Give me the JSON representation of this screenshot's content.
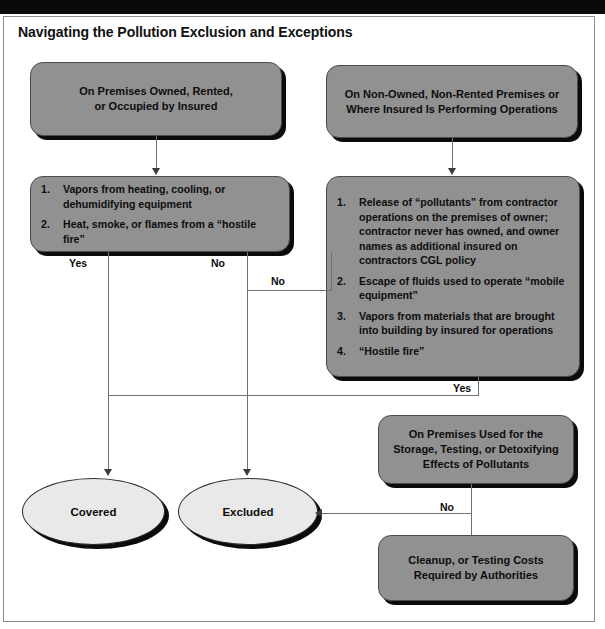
{
  "title": "Navigating the Pollution Exclusion and Exceptions",
  "colors": {
    "box_fill": "#919191",
    "box_border": "#4c4c4c",
    "shadow": "#0b0b0b",
    "ellipse_fill": "#e9e9e9",
    "line": "#6f6f6f",
    "text": "#0d0d0d",
    "top_bar": "#0a0a0a",
    "frame_border": "#8d8d8d"
  },
  "nodes": {
    "premises_owned": {
      "line1": "On Premises Owned, Rented,",
      "line2": "or Occupied by Insured"
    },
    "non_owned": {
      "line1": "On Non-Owned, Non-Rented Premises or",
      "line2": "Where Insured Is Performing Operations"
    },
    "owned_exceptions": {
      "items": [
        {
          "num": "1.",
          "text": "Vapors from heating, cooling, or dehumidifying equipment"
        },
        {
          "num": "2.",
          "text": "Heat, smoke, or flames from a “hostile fire”"
        }
      ]
    },
    "non_owned_exceptions": {
      "items": [
        {
          "num": "1.",
          "text": "Release of “pollutants” from contractor operations on the premises of owner; contractor never has owned, and owner names as additional insured on contractors CGL policy"
        },
        {
          "num": "2.",
          "text": "Escape of fluids used to operate “mobile equipment”"
        },
        {
          "num": "3.",
          "text": "Vapors from materials that are brought into building by insured for operations"
        },
        {
          "num": "4.",
          "text": "“Hostile fire”"
        }
      ]
    },
    "storage_testing": {
      "line1": "On Premises Used for the",
      "line2": "Storage, Testing, or Detoxifying",
      "line3": "Effects of Pollutants"
    },
    "cleanup_costs": {
      "line1": "Cleanup, or Testing Costs",
      "line2": "Required by Authorities"
    },
    "covered": {
      "label": "Covered"
    },
    "excluded": {
      "label": "Excluded"
    }
  },
  "edge_labels": {
    "owned_yes": "Yes",
    "owned_no": "No",
    "non_owned_no": "No",
    "non_owned_yes": "Yes",
    "storage_no": "No"
  }
}
